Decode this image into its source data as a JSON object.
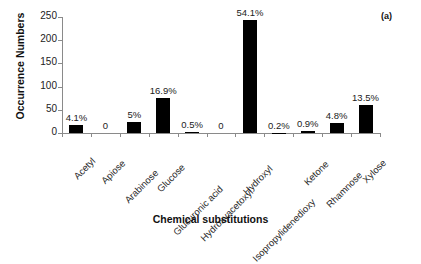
{
  "panel": {
    "tag": "(a)"
  },
  "chart_data": {
    "type": "bar",
    "title": "",
    "xlabel": "Chemical substitutions",
    "ylabel": "Occurrence Numbers",
    "ylim": [
      0,
      250
    ],
    "yticks": [
      0,
      50,
      100,
      150,
      200,
      250
    ],
    "grid": false,
    "legend": "none",
    "bar_color": "#000000",
    "categories": [
      "Acetyl",
      "Apiose",
      "Arabinose",
      "Glucose",
      "Glucuronic acid",
      "Hydroxyacetoxyl",
      "Hydroxyl",
      "Isopropylidenedioxy",
      "Ketone",
      "Rhamnose",
      "Xylose"
    ],
    "values": [
      18,
      0,
      23,
      76,
      2,
      0,
      243,
      1,
      4,
      22,
      61
    ],
    "data_labels": [
      "4.1%",
      "0",
      "5%",
      "16.9%",
      "0.5%",
      "0",
      "54.1%",
      "0.2%",
      "0.9%",
      "4.8%",
      "13.5%"
    ]
  }
}
